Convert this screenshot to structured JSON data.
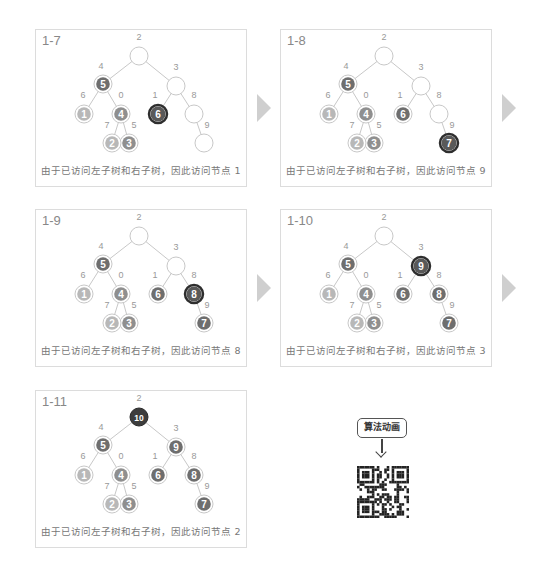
{
  "colors": {
    "edge": "#c8c8c8",
    "empty_fill": "#ffffff",
    "empty_stroke": "#c8c8c8",
    "light_fill": "#b8b8b8",
    "mid_fill": "#8f8f8f",
    "dark_fill": "#6e6e6e",
    "current_fill": "#595959",
    "current_ring": "#2e2e2e",
    "root_final_fill": "#3d3d3d",
    "node_label": "#999999",
    "node_text": "#ffffff",
    "arrow": "#cfcfcf"
  },
  "tree": {
    "nodes": {
      "2": {
        "x": 103,
        "y": 26,
        "label_dx": 0,
        "label_dy": -16
      },
      "3": {
        "x": 140,
        "y": 56,
        "label_dx": 0,
        "label_dy": -16
      },
      "4": {
        "x": 67,
        "y": 54,
        "label_dx": -2,
        "label_dy": -15
      },
      "6": {
        "x": 48,
        "y": 84,
        "label_dx": -1,
        "label_dy": -16
      },
      "0": {
        "x": 85,
        "y": 84,
        "label_dx": 0,
        "label_dy": -16
      },
      "1": {
        "x": 122,
        "y": 84,
        "label_dx": -3,
        "label_dy": -16
      },
      "8": {
        "x": 158,
        "y": 84,
        "label_dx": 0,
        "label_dy": -16
      },
      "7": {
        "x": 76,
        "y": 113,
        "label_dx": -5,
        "label_dy": -15
      },
      "5": {
        "x": 93,
        "y": 113,
        "label_dx": 5,
        "label_dy": -15
      },
      "9": {
        "x": 168,
        "y": 113,
        "label_dx": 3,
        "label_dy": -15
      }
    },
    "edges": [
      [
        "2",
        "4"
      ],
      [
        "2",
        "3"
      ],
      [
        "4",
        "6"
      ],
      [
        "4",
        "0"
      ],
      [
        "3",
        "1"
      ],
      [
        "3",
        "8"
      ],
      [
        "0",
        "7"
      ],
      [
        "0",
        "5"
      ],
      [
        "8",
        "9"
      ]
    ]
  },
  "panels": [
    {
      "id": "1-7",
      "title": "1-7",
      "caption": "由于已访问左子树和右子树，因此访问节点 1",
      "nodes": {
        "2": {
          "state": "empty",
          "value": ""
        },
        "3": {
          "state": "empty",
          "value": ""
        },
        "4": {
          "state": "dark",
          "value": "5"
        },
        "6": {
          "state": "light",
          "value": "1"
        },
        "0": {
          "state": "mid",
          "value": "4"
        },
        "1": {
          "state": "current",
          "value": "6"
        },
        "8": {
          "state": "empty",
          "value": ""
        },
        "7": {
          "state": "light",
          "value": "2"
        },
        "5": {
          "state": "mid",
          "value": "3"
        },
        "9": {
          "state": "empty",
          "value": ""
        }
      }
    },
    {
      "id": "1-8",
      "title": "1-8",
      "caption": "由于已访问左子树和右子树，因此访问节点 9",
      "nodes": {
        "2": {
          "state": "empty",
          "value": ""
        },
        "3": {
          "state": "empty",
          "value": ""
        },
        "4": {
          "state": "dark",
          "value": "5"
        },
        "6": {
          "state": "light",
          "value": "1"
        },
        "0": {
          "state": "mid",
          "value": "4"
        },
        "1": {
          "state": "dark",
          "value": "6"
        },
        "8": {
          "state": "empty",
          "value": ""
        },
        "7": {
          "state": "light",
          "value": "2"
        },
        "5": {
          "state": "mid",
          "value": "3"
        },
        "9": {
          "state": "current",
          "value": "7"
        }
      }
    },
    {
      "id": "1-9",
      "title": "1-9",
      "caption": "由于已访问左子树和右子树，因此访问节点 8",
      "nodes": {
        "2": {
          "state": "empty",
          "value": ""
        },
        "3": {
          "state": "empty",
          "value": ""
        },
        "4": {
          "state": "dark",
          "value": "5"
        },
        "6": {
          "state": "light",
          "value": "1"
        },
        "0": {
          "state": "mid",
          "value": "4"
        },
        "1": {
          "state": "dark",
          "value": "6"
        },
        "8": {
          "state": "current",
          "value": "8"
        },
        "7": {
          "state": "light",
          "value": "2"
        },
        "5": {
          "state": "mid",
          "value": "3"
        },
        "9": {
          "state": "dark",
          "value": "7"
        }
      }
    },
    {
      "id": "1-10",
      "title": "1-10",
      "caption": "由于已访问左子树和右子树，因此访问节点 3",
      "nodes": {
        "2": {
          "state": "empty",
          "value": ""
        },
        "3": {
          "state": "current",
          "value": "9"
        },
        "4": {
          "state": "dark",
          "value": "5"
        },
        "6": {
          "state": "light",
          "value": "1"
        },
        "0": {
          "state": "mid",
          "value": "4"
        },
        "1": {
          "state": "dark",
          "value": "6"
        },
        "8": {
          "state": "dark",
          "value": "8"
        },
        "7": {
          "state": "light",
          "value": "2"
        },
        "5": {
          "state": "mid",
          "value": "3"
        },
        "9": {
          "state": "dark",
          "value": "7"
        }
      }
    },
    {
      "id": "1-11",
      "title": "1-11",
      "caption": "由于已访问左子树和右子树，因此访问节点 2",
      "nodes": {
        "2": {
          "state": "root_final",
          "value": "10"
        },
        "3": {
          "state": "dark",
          "value": "9"
        },
        "4": {
          "state": "dark",
          "value": "5"
        },
        "6": {
          "state": "light",
          "value": "1"
        },
        "0": {
          "state": "mid",
          "value": "4"
        },
        "1": {
          "state": "dark",
          "value": "6"
        },
        "8": {
          "state": "dark",
          "value": "8"
        },
        "7": {
          "state": "light",
          "value": "2"
        },
        "5": {
          "state": "mid",
          "value": "3"
        },
        "9": {
          "state": "dark",
          "value": "7"
        }
      }
    }
  ],
  "layout": {
    "panels": [
      {
        "left": 35,
        "top": 29
      },
      {
        "left": 280,
        "top": 29
      },
      {
        "left": 35,
        "top": 209
      },
      {
        "left": 280,
        "top": 209
      },
      {
        "left": 35,
        "top": 390
      }
    ],
    "arrows": [
      {
        "left": 257,
        "top": 94
      },
      {
        "left": 502,
        "top": 94
      },
      {
        "left": 257,
        "top": 274
      },
      {
        "left": 502,
        "top": 274
      }
    ]
  },
  "animation_link": {
    "label": "算法动画",
    "icon": "arrow-down-icon",
    "qr_icon": "qr-code-icon"
  }
}
